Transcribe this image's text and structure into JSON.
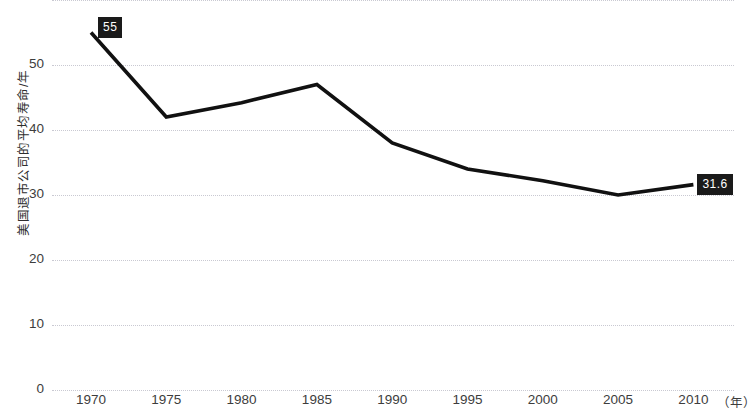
{
  "chart_data": {
    "type": "line",
    "title": "",
    "subtitle": "",
    "xlabel": "",
    "ylabel": "美国退市公司的平均寿命/年",
    "x_unit": "（年）",
    "x": [
      1970,
      1975,
      1980,
      1985,
      1990,
      1995,
      2000,
      2005,
      2010
    ],
    "categories": [
      "1970",
      "1975",
      "1980",
      "1985",
      "1990",
      "1995",
      "2000",
      "2005",
      "2010"
    ],
    "values": [
      55,
      42,
      44.2,
      47,
      38,
      34,
      32.2,
      30,
      31.6
    ],
    "series": [
      {
        "name": "美国退市公司的平均寿命",
        "values": [
          55,
          42,
          44.2,
          47,
          38,
          34,
          32.2,
          30,
          31.6
        ]
      }
    ],
    "point_labels": [
      {
        "index": 0,
        "text": "55",
        "value": 55
      },
      {
        "index": 8,
        "text": "31.6",
        "value": 31.6
      }
    ],
    "xlim": [
      1970,
      2010
    ],
    "ylim": [
      0,
      60
    ],
    "y_ticks": [
      0,
      10,
      20,
      30,
      40,
      50
    ],
    "y_tick_labels": [
      "0",
      "10",
      "20",
      "30",
      "40",
      "50"
    ],
    "y_gridlines": [
      0,
      10,
      20,
      30,
      40,
      50,
      60
    ],
    "x_ticks": [
      1970,
      1975,
      1980,
      1985,
      1990,
      1995,
      2000,
      2005,
      2010
    ],
    "x_tick_labels": [
      "1970",
      "1975",
      "1980",
      "1985",
      "1990",
      "1995",
      "2000",
      "2005",
      "2010"
    ],
    "grid": true,
    "grid_style": "dotted",
    "legend": false,
    "legend_position": "none",
    "line_color": "#111111",
    "grid_color": "#c9c9d2",
    "label_bg_color": "#1a1a1a",
    "label_text_color": "#ffffff",
    "background_color": "#ffffff"
  },
  "axes": {
    "y_title": "美国退市公司的平均寿命/年",
    "y_ticks": [
      {
        "label": "50",
        "value": 50
      },
      {
        "label": "40",
        "value": 40
      },
      {
        "label": "30",
        "value": 30
      },
      {
        "label": "20",
        "value": 20
      },
      {
        "label": "10",
        "value": 10
      },
      {
        "label": "0",
        "value": 0
      }
    ],
    "x_ticks": [
      {
        "label": "1970"
      },
      {
        "label": "1975"
      },
      {
        "label": "1980"
      },
      {
        "label": "1985"
      },
      {
        "label": "1990"
      },
      {
        "label": "1995"
      },
      {
        "label": "2000"
      },
      {
        "label": "2005"
      },
      {
        "label": "2010"
      }
    ],
    "x_unit_label": "（年）"
  },
  "labels": {
    "start_point": "55",
    "end_point": "31.6"
  }
}
